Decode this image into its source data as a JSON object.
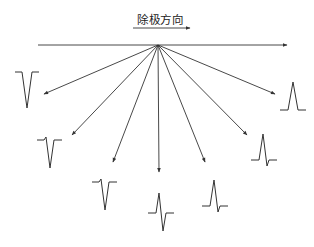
{
  "title": "除极方向",
  "colors": {
    "stroke": "#333333",
    "background": "#ffffff"
  },
  "origin": {
    "x": 158,
    "y": 45
  },
  "direction_arrow": {
    "x1": 133,
    "y1": 28,
    "x2": 190,
    "y2": 28
  },
  "baseline_arrow": {
    "x1": 38,
    "y1": 45,
    "x2": 287,
    "y2": 45
  },
  "leads": [
    {
      "name": "lead-1",
      "tip": [
        44,
        94
      ],
      "waveform": "QS",
      "pos": [
        15,
        72
      ]
    },
    {
      "name": "lead-2",
      "tip": [
        72,
        135
      ],
      "waveform": "rS",
      "pos": [
        37,
        136
      ]
    },
    {
      "name": "lead-3",
      "tip": [
        113,
        162
      ],
      "waveform": "rS",
      "pos": [
        92,
        178
      ]
    },
    {
      "name": "lead-4",
      "tip": [
        159,
        172
      ],
      "waveform": "RS",
      "pos": [
        148,
        193
      ]
    },
    {
      "name": "lead-5",
      "tip": [
        205,
        162
      ],
      "waveform": "Rs",
      "pos": [
        202,
        178
      ]
    },
    {
      "name": "lead-6",
      "tip": [
        247,
        135
      ],
      "waveform": "Rs",
      "pos": [
        251,
        132
      ]
    },
    {
      "name": "lead-7",
      "tip": [
        275,
        94
      ],
      "waveform": "R",
      "pos": [
        280,
        72
      ]
    }
  ]
}
